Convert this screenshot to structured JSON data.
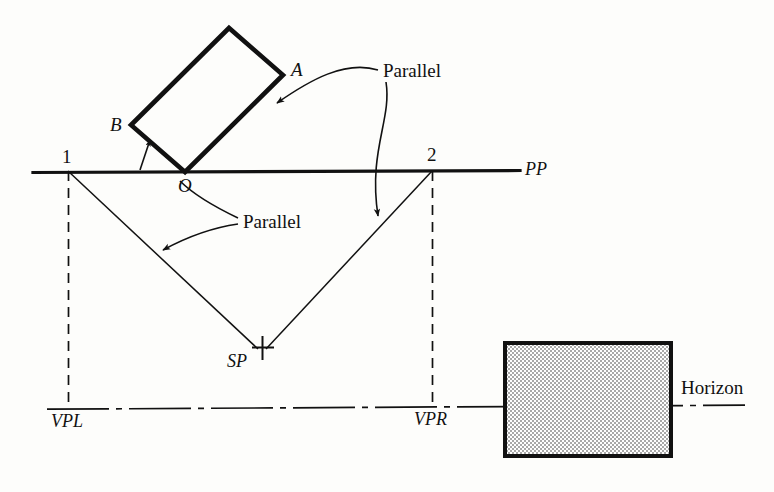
{
  "figure": {
    "type": "perspective-construction-diagram",
    "background_color": "#fdfdfb",
    "ink_color": "#111111",
    "fill_color": "#c8c8c8"
  },
  "labels": {
    "point_a": "A",
    "point_b": "B",
    "point_o": "O",
    "station_point": "SP",
    "picture_plane": "PP",
    "measure_point_left": "1",
    "measure_point_right": "2",
    "vanishing_point_left": "VPL",
    "vanishing_point_right": "VPR",
    "parallel_upper": "Parallel",
    "parallel_lower": "Parallel",
    "horizon": "Horizon"
  },
  "geometry": {
    "picture_plane_line": {
      "x1": 33,
      "y1": 172,
      "x2": 520,
      "y2": 170
    },
    "horizon_line": {
      "x1": 47,
      "y1": 409,
      "x2": 745,
      "y2": 405
    },
    "object_rect_corners": [
      {
        "name": "O",
        "x": 185,
        "y": 172
      },
      {
        "name": "B",
        "x": 131,
        "y": 125
      },
      {
        "name": "top",
        "x": 229,
        "y": 28
      },
      {
        "name": "A",
        "x": 283,
        "y": 75
      }
    ],
    "sight_lines": [
      {
        "from": "1",
        "to": "SP",
        "x1": 68,
        "y1": 171,
        "x2": 257,
        "y2": 348
      },
      {
        "from": "2",
        "to": "SP",
        "x1": 432,
        "y1": 171,
        "x2": 257,
        "y2": 348
      }
    ],
    "dashed_verticals": [
      {
        "label": "VPL",
        "x": 68,
        "y1": 171,
        "y2": 408
      },
      {
        "label": "VPR",
        "x": 432,
        "y1": 171,
        "y2": 407
      }
    ],
    "shaded_rectangle": {
      "x": 505,
      "y": 343,
      "width": 166,
      "height": 113
    },
    "station_point_marker": {
      "x": 262,
      "y": 346,
      "style": "plus-cross"
    }
  }
}
